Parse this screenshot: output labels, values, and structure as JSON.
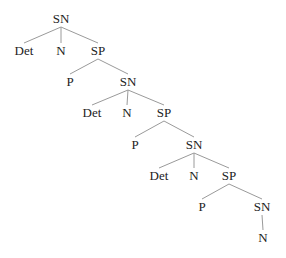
{
  "diagram": {
    "type": "syntax-tree",
    "colors": {
      "edge": "#9a9a9a",
      "label": "#222222",
      "background": "#ffffff"
    },
    "nodes": [
      {
        "id": "sn1",
        "label": "SN",
        "x": 61,
        "y": 23
      },
      {
        "id": "det1",
        "label": "Det",
        "x": 24,
        "y": 55
      },
      {
        "id": "n1",
        "label": "N",
        "x": 61,
        "y": 55
      },
      {
        "id": "sp1",
        "label": "SP",
        "x": 98,
        "y": 55
      },
      {
        "id": "p1",
        "label": "P",
        "x": 70,
        "y": 86
      },
      {
        "id": "sn2",
        "label": "SN",
        "x": 128,
        "y": 86
      },
      {
        "id": "det2",
        "label": "Det",
        "x": 92,
        "y": 117
      },
      {
        "id": "n2",
        "label": "N",
        "x": 127,
        "y": 117
      },
      {
        "id": "sp2",
        "label": "SP",
        "x": 164,
        "y": 117
      },
      {
        "id": "p2",
        "label": "P",
        "x": 135,
        "y": 149
      },
      {
        "id": "sn3",
        "label": "SN",
        "x": 194,
        "y": 149
      },
      {
        "id": "det3",
        "label": "Det",
        "x": 159,
        "y": 180
      },
      {
        "id": "n3",
        "label": "N",
        "x": 194,
        "y": 180
      },
      {
        "id": "sp3",
        "label": "SP",
        "x": 229,
        "y": 180
      },
      {
        "id": "p3",
        "label": "P",
        "x": 202,
        "y": 211
      },
      {
        "id": "sn4",
        "label": "SN",
        "x": 262,
        "y": 211
      },
      {
        "id": "n4",
        "label": "N",
        "x": 263,
        "y": 242
      }
    ],
    "edges": [
      [
        "sn1",
        "det1"
      ],
      [
        "sn1",
        "n1"
      ],
      [
        "sn1",
        "sp1"
      ],
      [
        "sp1",
        "p1"
      ],
      [
        "sp1",
        "sn2"
      ],
      [
        "sn2",
        "det2"
      ],
      [
        "sn2",
        "n2"
      ],
      [
        "sn2",
        "sp2"
      ],
      [
        "sp2",
        "p2"
      ],
      [
        "sp2",
        "sn3"
      ],
      [
        "sn3",
        "det3"
      ],
      [
        "sn3",
        "n3"
      ],
      [
        "sn3",
        "sp3"
      ],
      [
        "sp3",
        "p3"
      ],
      [
        "sp3",
        "sn4"
      ],
      [
        "sn4",
        "n4"
      ]
    ]
  }
}
